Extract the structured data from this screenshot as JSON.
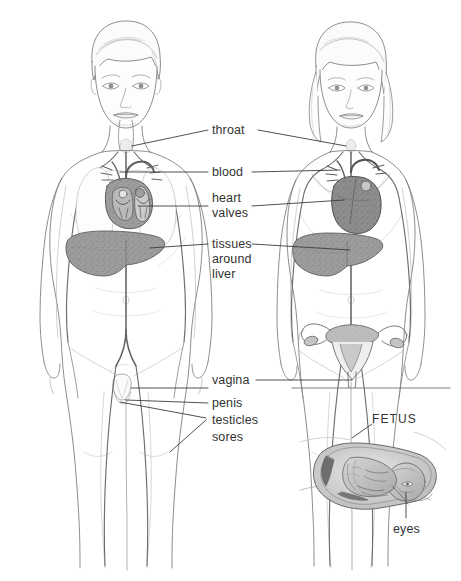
{
  "figure": {
    "width": 461,
    "height": 581,
    "background": "#ffffff",
    "ink": "#6f6f6f",
    "ink_dark": "#3c3c3c",
    "label_color": "#333333",
    "organ_fill": "#9a9a9a",
    "organ_fill_dark": "#8a8a8a",
    "skin_fill": "#fdfdfd"
  },
  "labels": {
    "throat": "throat",
    "blood": "blood",
    "heart": "heart",
    "valves": "valves",
    "tissues": "tissues",
    "around": "around",
    "liver": "liver",
    "vagina": "vagina",
    "penis": "penis",
    "testicles": "testicles",
    "sores": "sores",
    "fetus": "FETUS",
    "eyes": "eyes"
  },
  "figures": {
    "male": {
      "name": "male-body-figure"
    },
    "female": {
      "name": "female-body-figure"
    },
    "uterus": {
      "name": "uterus-detail"
    },
    "fetus_inset": {
      "name": "fetus-in-womb-inset"
    }
  }
}
